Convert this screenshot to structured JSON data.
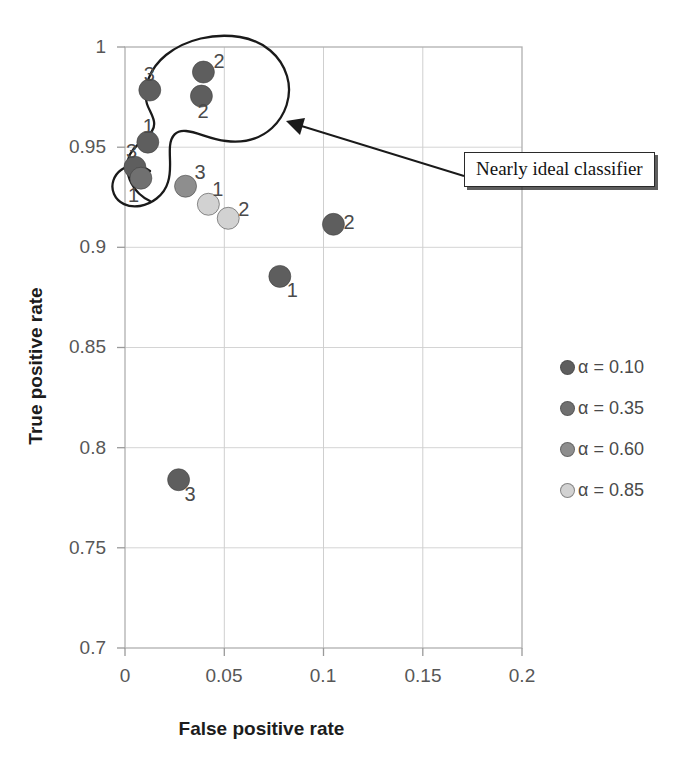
{
  "chart_data": {
    "type": "scatter",
    "title": "",
    "xlabel": "False positive rate",
    "ylabel": "True positive rate",
    "xlim": [
      0,
      0.2
    ],
    "ylim": [
      0.7,
      1.0
    ],
    "xticks": [
      "0",
      "0.05",
      "0.1",
      "0.15",
      "0.2"
    ],
    "xtick_values": [
      0,
      0.05,
      0.1,
      0.15,
      0.2
    ],
    "yticks": [
      "0.7",
      "0.75",
      "0.8",
      "0.85",
      "0.9",
      "0.95",
      "1"
    ],
    "ytick_values": [
      0.7,
      0.75,
      0.8,
      0.85,
      0.9,
      0.95,
      1.0
    ],
    "grid": true,
    "legend_position": "right",
    "legend": [
      {
        "label": "α = 0.10",
        "color": "#5e5e5e"
      },
      {
        "label": "α = 0.35",
        "color": "#707070"
      },
      {
        "label": "α = 0.60",
        "color": "#8e8e8e"
      },
      {
        "label": "α = 0.85",
        "color": "#d2d2d2"
      }
    ],
    "series": [
      {
        "name": "α = 0.10",
        "color": "#5e5e5e",
        "points": [
          {
            "x": 0.0395,
            "y": 0.9875,
            "label": "2"
          },
          {
            "x": 0.0385,
            "y": 0.9755,
            "label": "2"
          },
          {
            "x": 0.0125,
            "y": 0.9785,
            "label": "3"
          },
          {
            "x": 0.0115,
            "y": 0.9525,
            "label": "1"
          },
          {
            "x": 0.005,
            "y": 0.94,
            "label": "3"
          },
          {
            "x": 0.105,
            "y": 0.9115,
            "label": "2"
          },
          {
            "x": 0.078,
            "y": 0.8855,
            "label": "1"
          },
          {
            "x": 0.027,
            "y": 0.784,
            "label": "3"
          }
        ]
      },
      {
        "name": "α = 0.35",
        "color": "#707070",
        "points": [
          {
            "x": 0.008,
            "y": 0.9345,
            "label": "1"
          }
        ]
      },
      {
        "name": "α = 0.60",
        "color": "#8e8e8e",
        "points": [
          {
            "x": 0.0305,
            "y": 0.9305,
            "label": "3"
          }
        ]
      },
      {
        "name": "α = 0.85",
        "color": "#d2d2d2",
        "points": [
          {
            "x": 0.042,
            "y": 0.9215,
            "label": "1"
          },
          {
            "x": 0.052,
            "y": 0.9145,
            "label": "2"
          }
        ]
      }
    ],
    "annotations": [
      {
        "text": "Nearly ideal classifier",
        "type": "callout-box-with-arrow",
        "points_to": {
          "x": 0.0455,
          "y": 0.9605
        }
      },
      {
        "type": "freehand-enclosure",
        "description": "hand-drawn closed curve around the upper-left cluster of points"
      }
    ]
  }
}
